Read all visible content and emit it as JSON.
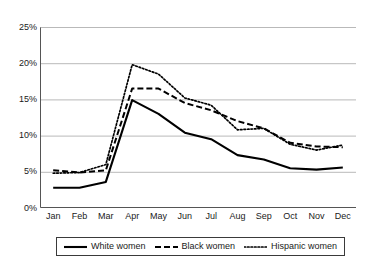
{
  "chart_data": {
    "type": "line",
    "title": "",
    "subtitle": "",
    "xlabel": "",
    "ylabel": "",
    "categories": [
      "Jan",
      "Feb",
      "Mar",
      "Apr",
      "May",
      "Jun",
      "Jul",
      "Aug",
      "Sep",
      "Oct",
      "Nov",
      "Dec"
    ],
    "ylim": [
      0,
      25
    ],
    "ytick_values": [
      0,
      5,
      10,
      15,
      20,
      25
    ],
    "ytick_labels": [
      "0%",
      "5%",
      "10%",
      "15%",
      "20%",
      "25%"
    ],
    "grid": "horizontal",
    "legend_position": "bottom",
    "series": [
      {
        "name": "White women",
        "style": "solid",
        "color": "#000000",
        "values": [
          2.8,
          2.8,
          3.6,
          14.9,
          13.0,
          10.4,
          9.5,
          7.3,
          6.7,
          5.5,
          5.3,
          5.6
        ]
      },
      {
        "name": "Black women",
        "style": "dashed",
        "color": "#000000",
        "values": [
          5.2,
          4.9,
          5.2,
          16.5,
          16.5,
          14.5,
          13.5,
          12.0,
          11.0,
          9.0,
          8.5,
          8.4
        ]
      },
      {
        "name": "Hispanic women",
        "style": "dotted",
        "color": "#000000",
        "values": [
          4.8,
          4.9,
          6.0,
          19.8,
          18.5,
          15.2,
          14.2,
          10.8,
          11.0,
          8.8,
          8.0,
          8.7
        ]
      }
    ]
  },
  "axis": {
    "y_labels": [
      "25%",
      "20%",
      "15%",
      "10%",
      "5%",
      "0%"
    ],
    "x_labels": [
      "Jan",
      "Feb",
      "Mar",
      "Apr",
      "May",
      "Jun",
      "Jul",
      "Aug",
      "Sep",
      "Oct",
      "Nov",
      "Dec"
    ]
  },
  "legend": {
    "entries": [
      {
        "label": "White women",
        "style": "solid"
      },
      {
        "label": "Black women",
        "style": "dashed"
      },
      {
        "label": "Hispanic women",
        "style": "dotted"
      }
    ]
  },
  "colors": {
    "line": "#000000",
    "grid": "#b9b9b9",
    "axis": "#555555",
    "background": "#ffffff",
    "text": "#1a1a1a"
  }
}
